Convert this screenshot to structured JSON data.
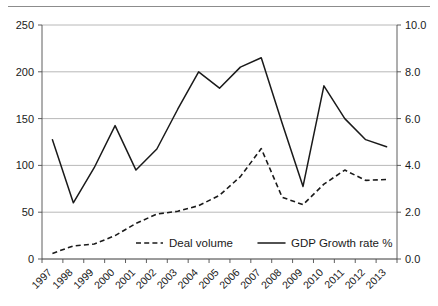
{
  "chart_data": {
    "type": "line",
    "title": "",
    "subtitle": "",
    "xlabel": "",
    "ylabel": "",
    "y2label": "",
    "grid": true,
    "legend_position": "inside-bottom-center",
    "categories": [
      "1997",
      "1998",
      "1999",
      "2000",
      "2001",
      "2002",
      "2003",
      "2004",
      "2005",
      "2006",
      "2007",
      "2008",
      "2009",
      "2010",
      "2011",
      "2012",
      "2013"
    ],
    "x_tick_labels": [
      "1997",
      "1998",
      "1999",
      "2000",
      "2001",
      "2002",
      "2003",
      "2004",
      "2005",
      "2006",
      "2007",
      "2008",
      "2009",
      "2010",
      "2011",
      "2012",
      "2013"
    ],
    "ylim": [
      0,
      250
    ],
    "y_ticks": [
      0,
      50,
      100,
      150,
      200,
      250
    ],
    "y_tick_labels": [
      "0",
      "50",
      "100",
      "150",
      "200",
      "250"
    ],
    "y2lim": [
      0,
      10
    ],
    "y2_ticks": [
      0,
      2,
      4,
      6,
      8,
      10
    ],
    "y2_tick_labels": [
      "0.0",
      "2.0",
      "4.0",
      "6.0",
      "8.0",
      "10.0"
    ],
    "series": [
      {
        "name": "Deal volume",
        "axis": "left",
        "style": "dashed",
        "color": "#1a1a1a",
        "values": [
          6,
          14,
          16,
          25,
          38,
          48,
          51,
          57,
          68,
          88,
          118,
          66,
          58,
          80,
          95,
          84,
          85
        ]
      },
      {
        "name": "GDP Growth rate %",
        "axis": "right",
        "style": "solid",
        "color": "#1a1a1a",
        "values": [
          5.1,
          2.4,
          3.9,
          5.7,
          3.8,
          4.7,
          6.4,
          8.0,
          7.3,
          8.2,
          8.6,
          5.8,
          3.1,
          7.4,
          6.0,
          5.1,
          4.8
        ]
      }
    ],
    "legend": [
      {
        "label": "Deal volume",
        "style": "dashed"
      },
      {
        "label": "GDP Growth rate %",
        "style": "solid"
      }
    ]
  }
}
